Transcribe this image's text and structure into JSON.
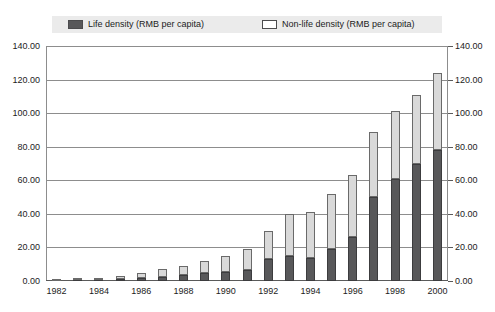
{
  "title_sliver": "",
  "legend": {
    "entries": [
      {
        "label": "Life density (RMB per capita)",
        "swatch": "dark-filled-swatch",
        "color": "#58585a"
      },
      {
        "label": "Non-life density (RMB per capita)",
        "swatch": "light-outlined-swatch",
        "color": "#ffffff"
      }
    ]
  },
  "chart_data": {
    "type": "bar",
    "subtype": "stacked-column",
    "title": "",
    "xlabel": "",
    "ylabel": "",
    "ylim": [
      0,
      140
    ],
    "ytick_step": 20,
    "grid": true,
    "legend_position": "top",
    "dual_y_axis": true,
    "ytick_labels": [
      "0.00",
      "20.00",
      "40.00",
      "60.00",
      "80.00",
      "100.00",
      "120.00",
      "140.00"
    ],
    "ytick_values": [
      0,
      20,
      40,
      60,
      80,
      100,
      120,
      140
    ],
    "categories": [
      "1982",
      "1983",
      "1984",
      "1985",
      "1986",
      "1987",
      "1988",
      "1989",
      "1990",
      "1991",
      "1992",
      "1993",
      "1994",
      "1995",
      "1996",
      "1997",
      "1998",
      "1999",
      "2000"
    ],
    "xtick_labels": [
      "1982",
      "1984",
      "1986",
      "1988",
      "1990",
      "1992",
      "1994",
      "1996",
      "1998",
      "2000"
    ],
    "series": [
      {
        "name": "Life density (RMB per capita)",
        "color": "#58585a",
        "values": [
          0.2,
          0.4,
          0.6,
          1.0,
          1.6,
          2.6,
          3.6,
          4.6,
          5.4,
          6.5,
          13.0,
          15.0,
          14.0,
          19.0,
          26.0,
          50.0,
          61.0,
          70.0,
          78.0
        ]
      },
      {
        "name": "Non-life density (RMB per capita)",
        "color": "#d9d9d9",
        "values": [
          0.6,
          1.0,
          1.4,
          2.0,
          3.4,
          4.4,
          5.4,
          7.4,
          9.6,
          12.5,
          17.0,
          25.0,
          27.0,
          33.0,
          37.0,
          39.0,
          40.0,
          41.0,
          46.0
        ]
      }
    ],
    "totals": [
      0.8,
      1.4,
      2.0,
      3.0,
      5.0,
      7.0,
      9.0,
      12.0,
      15.0,
      19.0,
      30.0,
      40.0,
      41.0,
      52.0,
      63.0,
      89.0,
      101.0,
      111.0,
      124.0
    ]
  }
}
